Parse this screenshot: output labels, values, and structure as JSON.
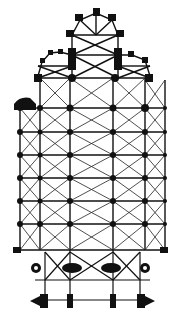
{
  "diagram": {
    "type": "architectural-floor-plan",
    "colors": {
      "ink": "#111111",
      "background": "#ffffff"
    },
    "grid": {
      "columns_x": [
        20,
        40,
        70,
        113,
        145,
        165
      ],
      "rows_y": [
        80,
        108,
        132,
        155,
        178,
        201,
        224,
        250,
        268
      ]
    },
    "caption": ""
  }
}
